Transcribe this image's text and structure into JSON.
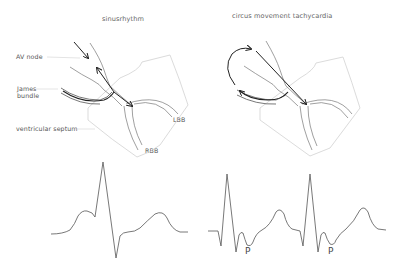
{
  "panels": [
    {
      "title": "sinusrhythm",
      "labels": {
        "av_node": "AV node",
        "james_bundle_line1": "James",
        "james_bundle_line2": "bundle",
        "ventricular_septum": "ventricular   septum",
        "lbb": "LBB",
        "rbb": "RBB"
      }
    },
    {
      "title": "circus   movement   tachycardia",
      "ecg_labels": [
        "P",
        "P"
      ]
    }
  ],
  "colors": {
    "line": "#333333",
    "light_line": "#cfcfcf",
    "leader": "#c8c8c8",
    "arrow": "#222222"
  }
}
